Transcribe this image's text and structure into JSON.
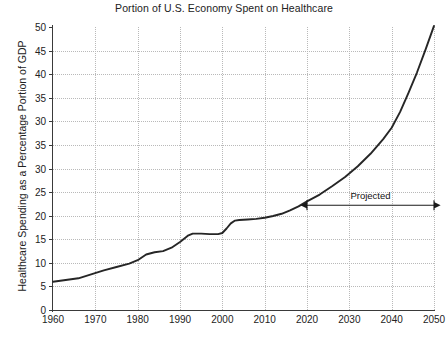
{
  "chart_data": {
    "type": "line",
    "title": "Portion of U.S. Economy Spent on Healthcare",
    "xlabel": "",
    "ylabel": "Healthcare Spending as a Percentage Portion of GDP",
    "xlim": [
      1960,
      2050
    ],
    "ylim": [
      0,
      50
    ],
    "grid": true,
    "legend": false,
    "x_tick_labels": [
      "1960",
      "1970",
      "1980",
      "1990",
      "2000",
      "2010",
      "2020",
      "2030",
      "2040",
      "2050"
    ],
    "x_ticks": [
      1960,
      1970,
      1980,
      1990,
      2000,
      2010,
      2020,
      2030,
      2040,
      2050
    ],
    "y_tick_labels": [
      "50",
      "45",
      "40",
      "35",
      "30",
      "35",
      "30",
      "25",
      "20",
      "15",
      "10",
      "5",
      "0"
    ],
    "y_tick_values": [
      50,
      45,
      40,
      35,
      30,
      35,
      30,
      25,
      20,
      15,
      10,
      5,
      0
    ],
    "annotations": [
      {
        "text": "Projected",
        "x_start": 2020,
        "x_end": 2050,
        "y": 18.5,
        "style": "double-arrow"
      }
    ],
    "series": [
      {
        "name": "Healthcare share of GDP",
        "color": "#262626",
        "x": [
          1960,
          1963,
          1966,
          1969,
          1972,
          1975,
          1978,
          1980,
          1982,
          1984,
          1986,
          1988,
          1990,
          1992,
          1993,
          1995,
          1997,
          1999,
          2000,
          2001,
          2002,
          2003,
          2004,
          2006,
          2008,
          2010,
          2012,
          2014,
          2016,
          2018,
          2020,
          2023,
          2026,
          2029,
          2032,
          2035,
          2038,
          2040,
          2042,
          2044,
          2046,
          2048,
          2050
        ],
        "values": [
          5.0,
          5.3,
          5.6,
          6.3,
          7.0,
          7.6,
          8.2,
          8.8,
          9.8,
          10.2,
          10.4,
          11.0,
          12.0,
          13.2,
          13.5,
          13.5,
          13.4,
          13.4,
          13.6,
          14.4,
          15.3,
          15.8,
          15.9,
          16.0,
          16.1,
          16.3,
          16.6,
          17.0,
          17.6,
          18.3,
          19.2,
          20.4,
          21.9,
          23.5,
          25.4,
          27.6,
          30.2,
          32.2,
          35.0,
          38.4,
          42.0,
          46.0,
          50.2
        ]
      }
    ]
  }
}
